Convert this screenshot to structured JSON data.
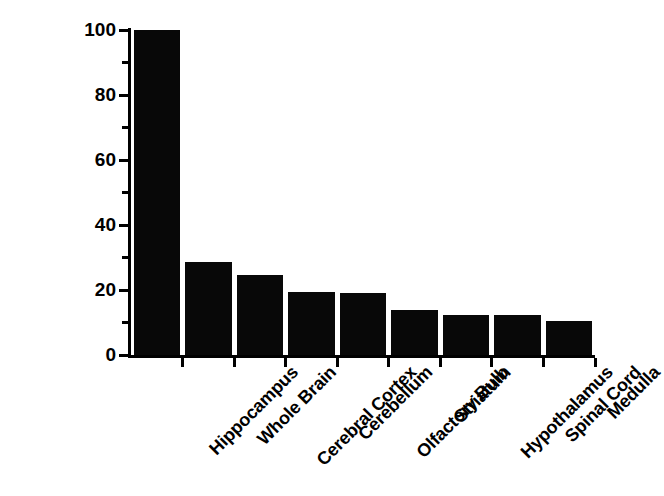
{
  "chart_data": {
    "type": "bar",
    "title": "",
    "xlabel": "",
    "ylabel_line1": "I-IL-1α Bound",
    "ylabel_superscript": "125",
    "ylabel_line2": "(% Relative to Hippocampus)",
    "categories": [
      "Hippocampus",
      "Whole Brain",
      "Cerebral Cortex",
      "Cerebellum",
      "Olfactory Bulb",
      "Striatum",
      "Hypothalamus",
      "Spinal Cord",
      "Medulla"
    ],
    "values": [
      100,
      28.5,
      24.5,
      19.5,
      19,
      13.8,
      12.2,
      12.2,
      10.5
    ],
    "ylim": [
      0,
      100
    ],
    "ytick_major": [
      0,
      20,
      40,
      60,
      80,
      100
    ],
    "ytick_major_labels": [
      "0",
      "20",
      "40",
      "60",
      "80",
      "100"
    ],
    "ytick_minor": [
      10,
      30,
      50,
      70,
      90
    ],
    "grid": false,
    "legend": null,
    "bar_color": "#080808",
    "axis_color": "#000000"
  }
}
